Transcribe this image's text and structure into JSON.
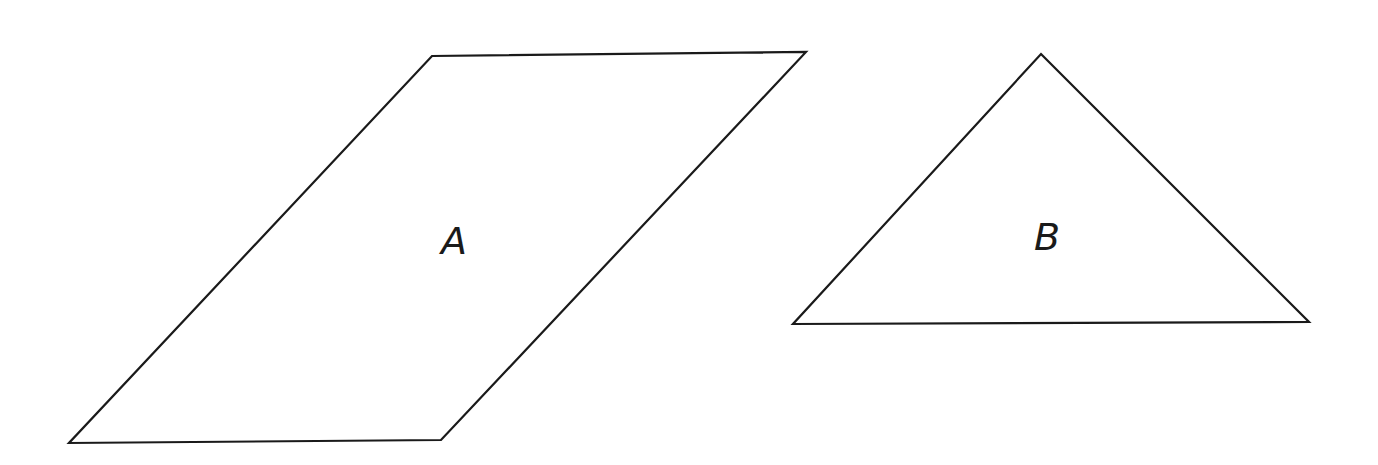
{
  "diagram": {
    "background": "#ffffff",
    "stroke_color": "#1a1a1a",
    "shapes": [
      {
        "type": "parallelogram",
        "label": "A",
        "points": "432,56 806,52 441,440 69,443",
        "label_pos": [
          468,
          254
        ]
      },
      {
        "type": "triangle",
        "label": "B",
        "points": "1041,54 1309,322 793,324",
        "label_pos": [
          1048,
          248
        ]
      }
    ]
  }
}
